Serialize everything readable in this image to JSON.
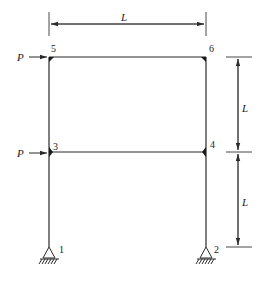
{
  "diagram": {
    "type": "two-story single-bay rigid frame",
    "colors": {
      "line": "#2a2a2a",
      "background": "#ffffff"
    },
    "nodes": [
      {
        "id": "1",
        "label": "1",
        "role": "pinned support, left base"
      },
      {
        "id": "2",
        "label": "2",
        "role": "pinned support, right base"
      },
      {
        "id": "3",
        "label": "3",
        "role": "left column / lower beam joint"
      },
      {
        "id": "4",
        "label": "4",
        "role": "right column / lower beam joint"
      },
      {
        "id": "5",
        "label": "5",
        "role": "left column / upper beam joint"
      },
      {
        "id": "6",
        "label": "6",
        "role": "right column / upper beam joint"
      }
    ],
    "members": [
      {
        "from": "1",
        "to": "3"
      },
      {
        "from": "3",
        "to": "5"
      },
      {
        "from": "2",
        "to": "4"
      },
      {
        "from": "4",
        "to": "6"
      },
      {
        "from": "3",
        "to": "4"
      },
      {
        "from": "5",
        "to": "6"
      }
    ],
    "loads": [
      {
        "label": "P",
        "node": "5",
        "direction": "horizontal, rightward"
      },
      {
        "label": "P",
        "node": "3",
        "direction": "horizontal, rightward"
      }
    ],
    "dimensions": {
      "span": {
        "label": "L"
      },
      "story_upper": {
        "label": "L"
      },
      "story_lower": {
        "label": "L"
      }
    }
  }
}
